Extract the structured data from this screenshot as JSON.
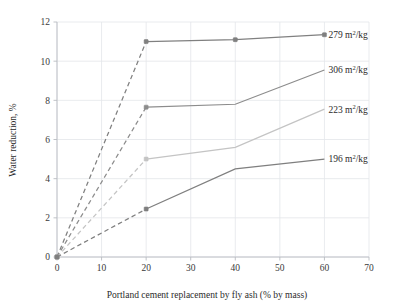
{
  "chart_data": {
    "type": "line",
    "title": "",
    "xlabel": "Portland cement replacement by fly ash (% by mass)",
    "ylabel": "Water reduction, %",
    "xlim": [
      0,
      70
    ],
    "ylim": [
      0,
      12
    ],
    "xticks": [
      0,
      10,
      20,
      30,
      40,
      50,
      60,
      70
    ],
    "yticks": [
      0,
      2,
      4,
      6,
      8,
      10,
      12
    ],
    "grid": true,
    "legend_position": "right-inline-end-of-line",
    "x": [
      0,
      20,
      40,
      60
    ],
    "series": [
      {
        "name": "279 m2/kg",
        "label_number": "279",
        "label_unit": "m",
        "label_exponent": "2",
        "label_denominator": "/kg",
        "color": "#808080",
        "values": [
          0,
          11.0,
          11.1,
          11.35
        ],
        "dashed_from_index": 0,
        "dashed_to_index": 1,
        "markers_at_x": [
          0,
          20,
          40,
          60
        ]
      },
      {
        "name": "306 m2/kg",
        "label_number": "306",
        "label_unit": "m",
        "label_exponent": "2",
        "label_denominator": "/kg",
        "color": "#8c8c8c",
        "values": [
          0,
          7.65,
          7.8,
          9.55
        ],
        "dashed_from_index": 0,
        "dashed_to_index": 1,
        "markers_at_x": [
          0,
          20
        ]
      },
      {
        "name": "223 m2/kg",
        "label_number": "223",
        "label_unit": "m",
        "label_exponent": "2",
        "label_denominator": "/kg",
        "color": "#c4c4c4",
        "values": [
          0,
          5.0,
          5.6,
          7.55
        ],
        "dashed_from_index": 0,
        "dashed_to_index": 1,
        "markers_at_x": [
          0,
          20
        ]
      },
      {
        "name": "196 m2/kg",
        "label_number": "196",
        "label_unit": "m",
        "label_exponent": "2",
        "label_denominator": "/kg",
        "color": "#7f7f7f",
        "values": [
          0,
          2.45,
          4.5,
          5.0
        ],
        "dashed_from_index": 0,
        "dashed_to_index": 1,
        "markers_at_x": [
          0,
          20
        ]
      }
    ],
    "colors": {
      "grid": "#e3e6ea",
      "axis": "#b9bcc2",
      "text": "#2b2b2b",
      "background": "#ffffff"
    }
  }
}
